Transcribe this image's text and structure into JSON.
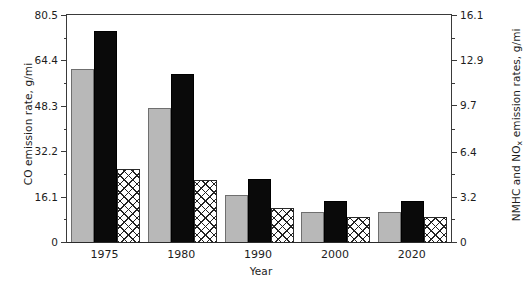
{
  "chart_data": {
    "type": "bar",
    "title": "",
    "xlabel": "Year",
    "ylabel": "CO emission rate, g/mi",
    "ylabel_right_prefix": "NMHC and NO",
    "ylabel_right_sub": "x",
    "ylabel_right_suffix": " emission rates, g/mi",
    "categories": [
      "1975",
      "1980",
      "1990",
      "2000",
      "2020"
    ],
    "ylim": [
      0,
      80.5
    ],
    "ylim_right": [
      0,
      16.1
    ],
    "yticks": [
      "0",
      "16.1",
      "32.2",
      "48.3",
      "64.4",
      "80.5"
    ],
    "ytick_values": [
      0,
      16.1,
      32.2,
      48.3,
      64.4,
      80.5
    ],
    "yticks_right": [
      "0",
      "3.2",
      "6.4",
      "9.7",
      "12.9",
      "16.1"
    ],
    "ytick_values_right": [
      0,
      3.2,
      6.4,
      9.7,
      12.9,
      16.1
    ],
    "grid": false,
    "legend": "none",
    "series": [
      {
        "name": "CO emission rate",
        "axis": "left",
        "style": "gray",
        "values": [
          61.5,
          47.5,
          16.5,
          10.5,
          10.5
        ]
      },
      {
        "name": "NMHC emission rate",
        "axis": "left",
        "style": "black",
        "values": [
          75.0,
          59.5,
          22.5,
          14.5,
          14.5
        ]
      },
      {
        "name": "NOx emission rate",
        "axis": "right",
        "style": "crosshatch",
        "values": [
          5.2,
          4.4,
          2.4,
          1.8,
          1.8
        ]
      }
    ]
  }
}
